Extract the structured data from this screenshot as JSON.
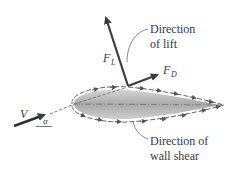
{
  "diagram": {
    "labels": {
      "lift_line1": "Direction",
      "lift_line2": "of lift",
      "shear_line1": "Direction of",
      "shear_line2": "wall shear",
      "F_L_main": "F",
      "F_L_sub": "L",
      "F_D_main": "F",
      "F_D_sub": "D",
      "velocity": "V",
      "angle": "α"
    },
    "elements": [
      "airfoil",
      "lift-arrow",
      "drag-arrow",
      "velocity-arrow",
      "wall-shear-arrows",
      "chord-line"
    ],
    "colors": {
      "arrow": "#3d3d3d",
      "airfoil_fill": "#bdbdbd",
      "text": "#3a3a3a"
    }
  }
}
